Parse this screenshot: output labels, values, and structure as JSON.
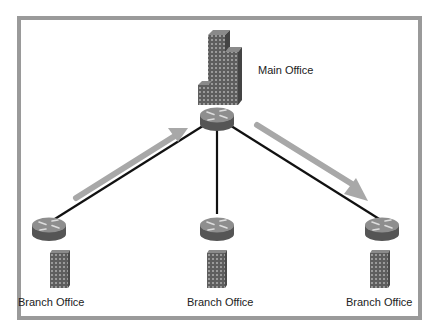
{
  "diagram": {
    "title_fragment": "",
    "main_office": {
      "label": "Main Office",
      "icon": "office-tower-icon",
      "router_icon": "router-icon"
    },
    "branches": [
      {
        "label": "Branch Office",
        "icon": "branch-building-icon",
        "router_icon": "router-icon"
      },
      {
        "label": "Branch Office",
        "icon": "branch-building-icon",
        "router_icon": "router-icon"
      },
      {
        "label": "Branch Office",
        "icon": "branch-building-icon",
        "router_icon": "router-icon"
      }
    ],
    "arrows": [
      {
        "direction": "branch-to-main",
        "from": "left branch",
        "to": "main office"
      },
      {
        "direction": "main-to-branch",
        "from": "main office",
        "to": "right branch"
      }
    ],
    "colors": {
      "frame": "#9a9a9a",
      "link": "#111111",
      "arrow": "#a8a8a8",
      "router_top": "#8c8c8c",
      "router_side": "#5a5a5a",
      "building": "#6a6a6a"
    }
  }
}
